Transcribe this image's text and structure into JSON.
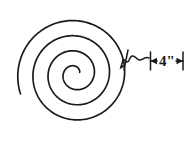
{
  "figure": {
    "background_color": "#ffffff",
    "ink_color": "#1a1a1a",
    "width": 195,
    "height": 147
  },
  "spiral": {
    "name": "archimedean-spiral",
    "center_x": 75,
    "center_y": 74,
    "start_radius": 5,
    "outer_radius": 58,
    "turns": 3.5,
    "start_angle_deg": 20,
    "stroke_width": 1.7
  },
  "annotation": {
    "leader": {
      "name": "squiggle-leader-line",
      "arrow_tip_x": 120,
      "arrow_tip_y": 68,
      "style": "wavy"
    },
    "dimension": {
      "label": "4\"",
      "value": 4,
      "unit": "inch",
      "left_tick_x": 150,
      "right_tick_x": 183,
      "baseline_y": 61,
      "arrow_style": "double-headed"
    }
  },
  "chart_data": {
    "type": "line",
    "xlabel": "",
    "ylabel": "",
    "series": [
      {
        "name": "spiral-curve",
        "description": "Archimedean spiral, 3.5 turns from center radius 5 to outer radius 58",
        "turns": 3.5,
        "r_min": 5,
        "r_max": 58
      }
    ],
    "annotations": [
      {
        "text": "4\"",
        "kind": "dimension",
        "points_to": "gap between adjacent spiral turns"
      }
    ],
    "grid": false,
    "legend": "none"
  }
}
